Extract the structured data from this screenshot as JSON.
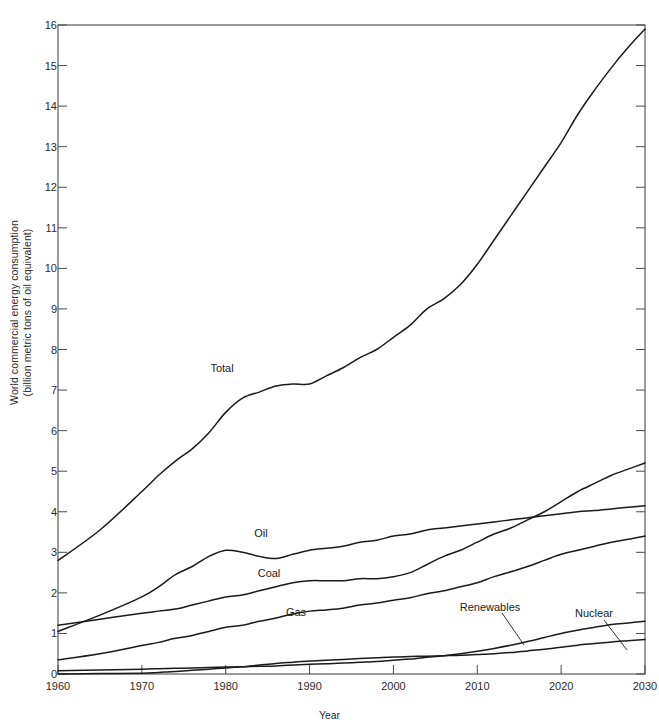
{
  "figure": {
    "title_visible_fragment": ""
  },
  "axes": {
    "ylabel_line1": "World commercial energy consumption",
    "ylabel_line2": "(billion metric tons of oil equivalent)",
    "xlabel": "Year",
    "yticks": [
      "0",
      "1",
      "2",
      "3",
      "4",
      "5",
      "6",
      "7",
      "8",
      "9",
      "10",
      "11",
      "12",
      "13",
      "14",
      "15",
      "16"
    ],
    "xticks": [
      "1960",
      "1970",
      "1980",
      "1990",
      "2000",
      "2010",
      "2020",
      "2030"
    ]
  },
  "series_labels": {
    "total": "Total",
    "oil": "Oil",
    "coal": "Coal",
    "gas": "Gas",
    "renewables": "Renewables",
    "nuclear": "Nuclear"
  },
  "colors": {
    "line": "#1a1a1a",
    "frame": "#4a4a4a",
    "text": "#2b2b2b"
  },
  "chart_data": {
    "type": "line",
    "xlabel": "Year",
    "ylabel": "World commercial energy consumption (billion metric tons of oil equivalent)",
    "xlim": [
      1960,
      2030
    ],
    "ylim": [
      0,
      16
    ],
    "grid": false,
    "legend": "inline-labels",
    "x": [
      1960,
      1965,
      1970,
      1972,
      1974,
      1976,
      1978,
      1980,
      1982,
      1984,
      1986,
      1988,
      1990,
      1992,
      1994,
      1996,
      1998,
      2000,
      2002,
      2004,
      2006,
      2008,
      2010,
      2012,
      2014,
      2016,
      2018,
      2020,
      2022,
      2024,
      2026,
      2028,
      2030
    ],
    "series": [
      {
        "name": "Total",
        "values": [
          2.8,
          3.55,
          4.5,
          4.9,
          5.25,
          5.55,
          5.95,
          6.45,
          6.8,
          6.95,
          7.1,
          7.15,
          7.15,
          7.35,
          7.55,
          7.8,
          8.0,
          8.3,
          8.6,
          9.0,
          9.25,
          9.6,
          10.1,
          10.7,
          11.3,
          11.9,
          12.5,
          13.1,
          13.8,
          14.4,
          14.95,
          15.45,
          15.9
        ]
      },
      {
        "name": "Coal",
        "values": [
          1.2,
          1.35,
          1.5,
          1.55,
          1.6,
          1.7,
          1.8,
          1.9,
          1.95,
          2.05,
          2.15,
          2.25,
          2.3,
          2.3,
          2.3,
          2.35,
          2.35,
          2.4,
          2.5,
          2.7,
          2.9,
          3.05,
          3.25,
          3.45,
          3.6,
          3.8,
          4.0,
          4.25,
          4.5,
          4.7,
          4.9,
          5.05,
          5.2
        ]
      },
      {
        "name": "Oil",
        "values": [
          1.05,
          1.45,
          1.9,
          2.15,
          2.45,
          2.65,
          2.9,
          3.05,
          3.0,
          2.9,
          2.85,
          2.95,
          3.05,
          3.1,
          3.15,
          3.25,
          3.3,
          3.4,
          3.45,
          3.55,
          3.6,
          3.65,
          3.7,
          3.75,
          3.8,
          3.85,
          3.9,
          3.95,
          4.0,
          4.03,
          4.07,
          4.11,
          4.15
        ]
      },
      {
        "name": "Gas",
        "values": [
          0.35,
          0.5,
          0.7,
          0.78,
          0.88,
          0.95,
          1.05,
          1.15,
          1.2,
          1.3,
          1.38,
          1.48,
          1.55,
          1.58,
          1.62,
          1.7,
          1.75,
          1.82,
          1.88,
          1.98,
          2.05,
          2.15,
          2.25,
          2.4,
          2.52,
          2.65,
          2.8,
          2.95,
          3.05,
          3.15,
          3.25,
          3.32,
          3.4
        ]
      },
      {
        "name": "Renewables",
        "values": [
          0.08,
          0.1,
          0.12,
          0.13,
          0.14,
          0.15,
          0.16,
          0.17,
          0.18,
          0.19,
          0.2,
          0.22,
          0.24,
          0.25,
          0.27,
          0.29,
          0.31,
          0.34,
          0.37,
          0.41,
          0.45,
          0.5,
          0.56,
          0.63,
          0.71,
          0.8,
          0.9,
          1.0,
          1.08,
          1.15,
          1.22,
          1.26,
          1.3
        ]
      },
      {
        "name": "Nuclear",
        "values": [
          0.0,
          0.01,
          0.02,
          0.04,
          0.06,
          0.09,
          0.12,
          0.15,
          0.18,
          0.22,
          0.26,
          0.29,
          0.32,
          0.34,
          0.36,
          0.38,
          0.4,
          0.42,
          0.43,
          0.44,
          0.45,
          0.46,
          0.48,
          0.5,
          0.53,
          0.57,
          0.61,
          0.66,
          0.71,
          0.75,
          0.79,
          0.82,
          0.85
        ]
      }
    ]
  }
}
